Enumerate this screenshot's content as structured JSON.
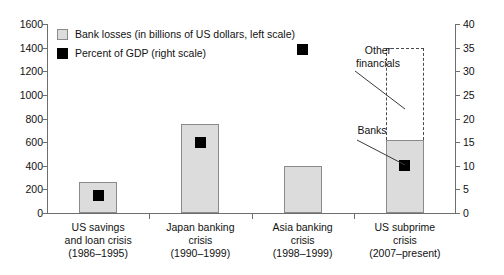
{
  "chart_data": {
    "type": "bar",
    "title": "",
    "xlabel": "",
    "ylabel": "",
    "grid": false,
    "legend_position": "top-left",
    "categories": [
      "US savings\nand loan crisis\n(1986–1995)",
      "Japan banking\ncrisis\n(1990–1999)",
      "Asia banking\ncrisis\n(1998–1999)",
      "US subprime\ncrisis\n(2007–present)"
    ],
    "category_lines": [
      [
        "US savings",
        "and loan crisis",
        "(1986–1995)"
      ],
      [
        "Japan banking",
        "crisis",
        "(1990–1999)"
      ],
      [
        "Asia banking",
        "crisis",
        "(1998–1999)"
      ],
      [
        "US subprime",
        "crisis",
        "(2007–present)"
      ]
    ],
    "series": [
      {
        "name": "Bank losses (in billions of US dollars, left scale)",
        "type": "bar",
        "axis": "left",
        "values": [
          260,
          750,
          400,
          620
        ],
        "extended_values": [
          null,
          null,
          null,
          1400
        ],
        "color": "#dcdcdc"
      },
      {
        "name": "Percent of GDP (right scale)",
        "type": "scatter",
        "axis": "right",
        "values": [
          3.8,
          15.0,
          34.5,
          10.0
        ],
        "color": "#000000"
      }
    ],
    "left_axis": {
      "min": 0,
      "max": 1600,
      "step": 200,
      "ticks": [
        0,
        200,
        400,
        600,
        800,
        1000,
        1200,
        1400,
        1600
      ]
    },
    "right_axis": {
      "min": 0,
      "max": 40,
      "step": 5,
      "ticks": [
        0,
        5,
        10,
        15,
        20,
        25,
        30,
        35,
        40
      ]
    },
    "annotations": [
      {
        "label_lines": [
          "Other",
          "financials"
        ],
        "target": "dashed-extension-bar-4"
      },
      {
        "label_lines": [
          "Banks"
        ],
        "target": "solid-bar-4"
      }
    ]
  },
  "legend": {
    "items": [
      {
        "label": "Bank losses (in billions of US dollars, left scale)",
        "swatch": "light-gray-square"
      },
      {
        "label": "Percent of GDP (right scale)",
        "swatch": "black-square"
      }
    ]
  },
  "annotations": {
    "other_financials": "Other\nfinancials",
    "other_financials_line1": "Other",
    "other_financials_line2": "financials",
    "banks": "Banks"
  }
}
